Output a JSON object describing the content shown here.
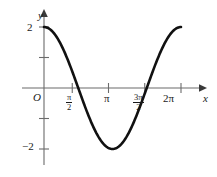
{
  "figure": {
    "axis_labels": {
      "x": "x",
      "y": "y"
    },
    "origin_label": "O",
    "y_ticks": [
      {
        "value": 2,
        "label": "2"
      },
      {
        "value": 1,
        "label": ""
      },
      {
        "value": -1,
        "label": ""
      },
      {
        "value": -2,
        "label": "−2"
      }
    ],
    "x_ticks": [
      {
        "value": 1.5708,
        "num": "π",
        "den": "2",
        "label": ""
      },
      {
        "value": 3.1416,
        "num": "",
        "den": "",
        "label": "π"
      },
      {
        "value": 4.7124,
        "num": "3π",
        "den": "2",
        "label": ""
      },
      {
        "value": 6.2832,
        "num": "",
        "den": "",
        "label": "2π"
      }
    ],
    "colors": {
      "curve": "#111111",
      "axis": "#6b6b6b",
      "arrow": "#3a3a3a",
      "text": "#1a1a1a",
      "background": "#ffffff"
    }
  },
  "chart_data": {
    "type": "line",
    "title": "",
    "xlabel": "x",
    "ylabel": "y",
    "xlim": [
      0,
      6.2832
    ],
    "ylim": [
      -2.6,
      2.6
    ],
    "grid": false,
    "legend": null,
    "function": "y = 2 cos(x)",
    "series": [
      {
        "name": "y = 2 cos(x)",
        "x": [
          0,
          0.3927,
          0.7854,
          1.1781,
          1.5708,
          1.9635,
          2.3562,
          2.7489,
          3.1416,
          3.5343,
          3.927,
          4.3197,
          4.7124,
          5.1051,
          5.4978,
          5.8905,
          6.2832
        ],
        "values": [
          2,
          1.8478,
          1.4142,
          0.7654,
          0,
          -0.7654,
          -1.4142,
          -1.8478,
          -2,
          -1.8478,
          -1.4142,
          -0.7654,
          0,
          0.7654,
          1.4142,
          1.8478,
          2
        ]
      }
    ],
    "key_points": {
      "start": [
        0,
        2
      ],
      "zero_1": [
        1.5708,
        0
      ],
      "minimum": [
        3.1416,
        -2
      ],
      "zero_2": [
        4.7124,
        0
      ],
      "end": [
        6.2832,
        2
      ]
    },
    "xtick_values": [
      1.5708,
      3.1416,
      4.7124,
      6.2832
    ],
    "xtick_labels": [
      "π/2",
      "π",
      "3π/2",
      "2π"
    ],
    "ytick_values": [
      2,
      1,
      -1,
      -2
    ],
    "ytick_labels": [
      "2",
      "",
      "",
      "−2"
    ]
  }
}
